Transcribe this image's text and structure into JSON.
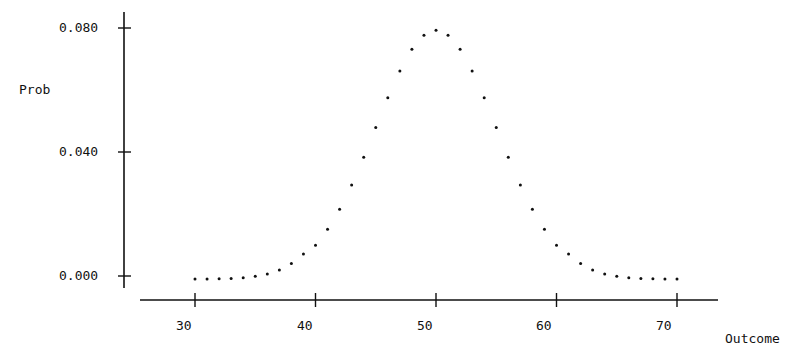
{
  "chart_data": {
    "type": "scatter",
    "title": "",
    "xlabel": "Outcome",
    "ylabel": "Prob",
    "x_ticks": [
      "30",
      "40",
      "50",
      "60",
      "70"
    ],
    "y_ticks": [
      "0.000",
      "0.040",
      "0.080"
    ],
    "xlim": [
      26,
      73
    ],
    "ylim": [
      0.0,
      0.085
    ],
    "grid": false,
    "legend": null,
    "series": [
      {
        "name": "Binomial(n=100, p=0.5)",
        "x": [
          30,
          31,
          32,
          33,
          34,
          35,
          36,
          37,
          38,
          39,
          40,
          41,
          42,
          43,
          44,
          45,
          46,
          47,
          48,
          49,
          50,
          51,
          52,
          53,
          54,
          55,
          56,
          57,
          58,
          59,
          60,
          61,
          62,
          63,
          64,
          65,
          66,
          67,
          68,
          69,
          70
        ],
        "values": [
          2e-05,
          4e-05,
          9e-05,
          0.0002,
          0.00042,
          0.00086,
          0.0016,
          0.0029,
          0.005,
          0.008,
          0.0108,
          0.0159,
          0.0223,
          0.0301,
          0.039,
          0.0485,
          0.058,
          0.0666,
          0.0735,
          0.078,
          0.0796,
          0.078,
          0.0735,
          0.0666,
          0.058,
          0.0485,
          0.039,
          0.0301,
          0.0223,
          0.0159,
          0.0108,
          0.008,
          0.005,
          0.0029,
          0.0016,
          0.00086,
          0.00042,
          0.0002,
          9e-05,
          4e-05,
          2e-05
        ]
      }
    ]
  },
  "axes": {
    "ylabel": "Prob",
    "xlabel": "Outcome",
    "y_tick_labels": [
      "0.080",
      "0.040",
      "0.000"
    ],
    "x_tick_labels": [
      "30",
      "40",
      "50",
      "60",
      "70"
    ]
  }
}
